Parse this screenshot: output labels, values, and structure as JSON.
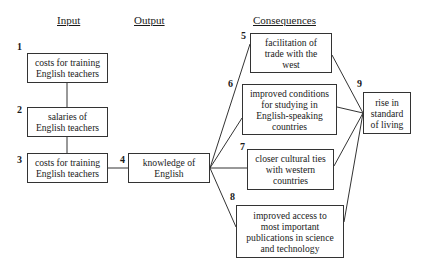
{
  "headers": {
    "input": "Input",
    "output": "Output",
    "consequences": "Consequences"
  },
  "nodes": [
    {
      "id": "1",
      "label": "costs for training\nEnglish teachers"
    },
    {
      "id": "2",
      "label": "salaries of\nEnglish teachers"
    },
    {
      "id": "3",
      "label": "costs for training\nEnglish teachers"
    },
    {
      "id": "4",
      "label": "knowledge of\nEnglish"
    },
    {
      "id": "5",
      "label": "facilitation of\ntrade with the\nwest"
    },
    {
      "id": "6",
      "label": "improved conditions\nfor studying in\nEnglish-speaking\ncountries"
    },
    {
      "id": "7",
      "label": "closer cultural ties\nwith  western\ncountries"
    },
    {
      "id": "8",
      "label": "improved access to\nmost important\npublications in science\nand technology"
    },
    {
      "id": "9",
      "label": "rise in\nstandard\nof living"
    }
  ],
  "edges": [
    [
      "1",
      "2"
    ],
    [
      "2",
      "3"
    ],
    [
      "3",
      "4"
    ],
    [
      "4",
      "5"
    ],
    [
      "4",
      "6"
    ],
    [
      "4",
      "7"
    ],
    [
      "4",
      "8"
    ],
    [
      "5",
      "9"
    ],
    [
      "6",
      "9"
    ],
    [
      "7",
      "9"
    ],
    [
      "8",
      "9"
    ]
  ]
}
